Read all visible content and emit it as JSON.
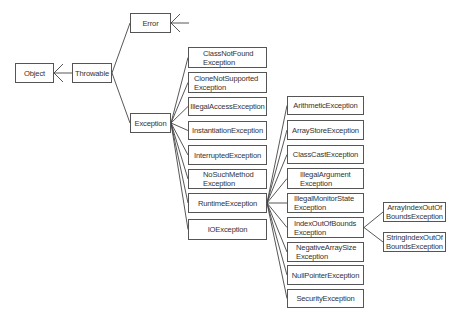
{
  "diagram": {
    "type": "class-hierarchy",
    "colors": {
      "border": "#555555",
      "text": "#333333",
      "line": "#444444",
      "background": "#ffffff"
    },
    "nodes": [
      {
        "id": "object",
        "label": "Object",
        "x": 15,
        "y": 63,
        "w": 39,
        "h": 20,
        "align": "center"
      },
      {
        "id": "throwable",
        "label": "Throwable",
        "x": 72,
        "y": 63,
        "w": 40,
        "h": 20,
        "align": "center"
      },
      {
        "id": "error",
        "label": "Error",
        "x": 130,
        "y": 13,
        "w": 41,
        "h": 20,
        "align": "center"
      },
      {
        "id": "exception",
        "label": "Exception",
        "x": 130,
        "y": 113,
        "w": 41,
        "h": 20,
        "align": "center"
      },
      {
        "id": "classnotfound",
        "label": "ClassNotFound\nException",
        "x": 188,
        "y": 47,
        "w": 79,
        "h": 21,
        "align": "left",
        "indent": 14
      },
      {
        "id": "clonenotsupported",
        "label": "CloneNotSupported\nException",
        "x": 188,
        "y": 72,
        "w": 79,
        "h": 21,
        "align": "left",
        "indent": 5
      },
      {
        "id": "illegalaccess",
        "label": "IllegalAccessException",
        "x": 188,
        "y": 97,
        "w": 79,
        "h": 19,
        "align": "center"
      },
      {
        "id": "instantiation",
        "label": "InstantiationException",
        "x": 188,
        "y": 121,
        "w": 79,
        "h": 19,
        "align": "center"
      },
      {
        "id": "interrupted",
        "label": "InterruptedException",
        "x": 188,
        "y": 145,
        "w": 79,
        "h": 20,
        "align": "center"
      },
      {
        "id": "nosuchmethod",
        "label": "NoSuchMethod\nException",
        "x": 188,
        "y": 169,
        "w": 79,
        "h": 20,
        "align": "left",
        "indent": 14
      },
      {
        "id": "runtime",
        "label": "RuntimeException",
        "x": 188,
        "y": 193,
        "w": 79,
        "h": 20,
        "align": "center"
      },
      {
        "id": "io",
        "label": "IOException",
        "x": 188,
        "y": 219,
        "w": 79,
        "h": 21,
        "align": "center"
      },
      {
        "id": "arithmetic",
        "label": "ArithmeticException",
        "x": 287,
        "y": 96,
        "w": 77,
        "h": 19,
        "align": "center"
      },
      {
        "id": "arraystore",
        "label": "ArrayStoreException",
        "x": 287,
        "y": 120,
        "w": 77,
        "h": 20,
        "align": "center"
      },
      {
        "id": "classcast",
        "label": "ClassCastException",
        "x": 287,
        "y": 145,
        "w": 77,
        "h": 19,
        "align": "center"
      },
      {
        "id": "illegalargument",
        "label": "IllegalArgument\nException",
        "x": 287,
        "y": 168,
        "w": 77,
        "h": 21,
        "align": "left",
        "indent": 12
      },
      {
        "id": "illegalmonitorstate",
        "label": "IllegalMonitorState\nException",
        "x": 287,
        "y": 193,
        "w": 77,
        "h": 20,
        "align": "left",
        "indent": 6
      },
      {
        "id": "indexoutofbounds",
        "label": "IndexOutOfBounds\nException",
        "x": 287,
        "y": 217,
        "w": 77,
        "h": 21,
        "align": "left",
        "indent": 6
      },
      {
        "id": "negativearraysize",
        "label": "NegativeArraySize\nException",
        "x": 287,
        "y": 242,
        "w": 77,
        "h": 20,
        "align": "left",
        "indent": 8
      },
      {
        "id": "nullpointer",
        "label": "NullPointerException",
        "x": 287,
        "y": 265,
        "w": 77,
        "h": 20,
        "align": "center"
      },
      {
        "id": "security",
        "label": "SecurityException",
        "x": 287,
        "y": 289,
        "w": 77,
        "h": 19,
        "align": "center"
      },
      {
        "id": "arrayindexoutofbounds",
        "label": "ArrayIndexOutOf\nBoundsException",
        "x": 383,
        "y": 202,
        "w": 63,
        "h": 20,
        "align": "center"
      },
      {
        "id": "stringindexoutofbounds",
        "label": "StringIndexOutOf\nBoundsException",
        "x": 383,
        "y": 232,
        "w": 63,
        "h": 20,
        "align": "center"
      }
    ],
    "edges": [
      {
        "from": "throwable",
        "to": "object",
        "style": "arrow-to-parent"
      },
      {
        "from": "error",
        "to": "throwable"
      },
      {
        "from": "exception",
        "to": "throwable"
      },
      {
        "from": "classnotfound",
        "to": "exception"
      },
      {
        "from": "clonenotsupported",
        "to": "exception"
      },
      {
        "from": "illegalaccess",
        "to": "exception"
      },
      {
        "from": "instantiation",
        "to": "exception"
      },
      {
        "from": "interrupted",
        "to": "exception"
      },
      {
        "from": "nosuchmethod",
        "to": "exception"
      },
      {
        "from": "runtime",
        "to": "exception"
      },
      {
        "from": "io",
        "to": "exception"
      },
      {
        "from": "arithmetic",
        "to": "runtime"
      },
      {
        "from": "arraystore",
        "to": "runtime"
      },
      {
        "from": "classcast",
        "to": "runtime"
      },
      {
        "from": "illegalargument",
        "to": "runtime"
      },
      {
        "from": "illegalmonitorstate",
        "to": "runtime"
      },
      {
        "from": "indexoutofbounds",
        "to": "runtime"
      },
      {
        "from": "negativearraysize",
        "to": "runtime"
      },
      {
        "from": "nullpointer",
        "to": "runtime"
      },
      {
        "from": "security",
        "to": "runtime"
      },
      {
        "from": "arrayindexoutofbounds",
        "to": "indexoutofbounds"
      },
      {
        "from": "stringindexoutofbounds",
        "to": "indexoutofbounds"
      }
    ],
    "open_arrow_stub": {
      "target": "error",
      "note": "arrow into Error from the right (subclasses omitted)"
    }
  }
}
